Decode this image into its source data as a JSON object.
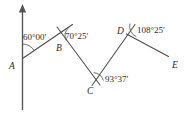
{
  "figure": {
    "background_color": "#ffffff",
    "line_color": "#4a4a4a",
    "text_color": "#2b2b2b",
    "width": 190,
    "height": 116
  },
  "points": {
    "a_label": "A",
    "b_label": "B",
    "c_label": "C",
    "d_label": "D",
    "e_label": "E"
  },
  "angles": {
    "at_a": "60°00′",
    "at_b": "70°25′",
    "at_c": "93°37′",
    "at_d": "108°25′"
  },
  "icons": {
    "meridian_arrow": "north-arrow-icon"
  }
}
